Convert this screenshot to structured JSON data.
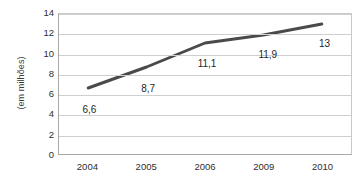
{
  "chart_data": {
    "type": "line",
    "title": "",
    "subtitle": "",
    "xlabel": "",
    "ylabel": "(em milhões)",
    "categories": [
      "2004",
      "2005",
      "2006",
      "2009",
      "2010"
    ],
    "values": [
      6.6,
      8.7,
      11.1,
      11.9,
      13.0
    ],
    "point_labels": [
      "6,6",
      "8,7",
      "11,1",
      "11,9",
      "13"
    ],
    "series": [
      {
        "name": "",
        "values": [
          6.6,
          8.7,
          11.1,
          11.9,
          13.0
        ],
        "color": "#4a4a4a"
      }
    ],
    "ylim": [
      0,
      14
    ],
    "ytick_step": 2,
    "ytick_labels": [
      "14",
      "12",
      "10",
      "8",
      "6",
      "4",
      "2",
      "0"
    ],
    "ytick_values": [
      14,
      12,
      10,
      8,
      6,
      4,
      2,
      0
    ],
    "grid": true,
    "grid_axis": "y",
    "legend": false,
    "legend_position": "none",
    "line_width": 3,
    "markers": false,
    "plot_border_color": "#b0b0b0",
    "gridline_color": "#cfcfcf",
    "background_color": "#ffffff",
    "text_color": "#2e2e2e"
  }
}
